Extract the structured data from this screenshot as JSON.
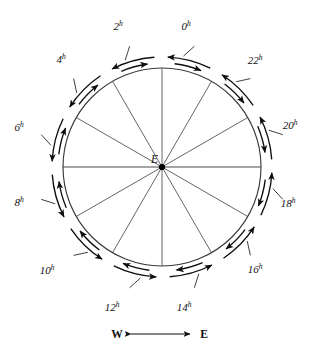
{
  "figure": {
    "type": "tidal-hour-diagram",
    "center_label": "E",
    "circle": {
      "cx": 162,
      "cy": 167,
      "r": 99
    },
    "spoke_count": 12,
    "spoke_step_degrees": 30,
    "hour_marks": [
      {
        "label": "0",
        "sup": "h",
        "angle_deg": 15,
        "label_x": 186,
        "label_y": 30
      },
      {
        "label": "2",
        "sup": "h",
        "angle_deg": 45,
        "label_x": 118,
        "label_y": 30
      },
      {
        "label": "4",
        "sup": "h",
        "angle_deg": 75,
        "label_x": 61,
        "label_y": 63
      },
      {
        "label": "6",
        "sup": "h",
        "angle_deg": 105,
        "label_x": 19,
        "label_y": 131
      },
      {
        "label": "8",
        "sup": "h",
        "angle_deg": 135,
        "label_x": 19,
        "label_y": 206
      },
      {
        "label": "10",
        "sup": "h",
        "angle_deg": 165,
        "label_x": 47,
        "label_y": 274
      },
      {
        "label": "12",
        "sup": "h",
        "angle_deg": 195,
        "label_x": 112,
        "label_y": 311
      },
      {
        "label": "14",
        "sup": "h",
        "angle_deg": 225,
        "label_x": 184,
        "label_y": 311
      },
      {
        "label": "16",
        "sup": "h",
        "angle_deg": 255,
        "label_x": 255,
        "label_y": 273
      },
      {
        "label": "18",
        "sup": "h",
        "angle_deg": 285,
        "label_x": 288,
        "label_y": 207
      },
      {
        "label": "20",
        "sup": "h",
        "angle_deg": 315,
        "label_x": 290,
        "label_y": 129
      },
      {
        "label": "22",
        "sup": "h",
        "angle_deg": 345,
        "label_x": 255,
        "label_y": 64
      }
    ],
    "legend": {
      "left_label": "W",
      "right_label": "E",
      "arrow": "double-headed-horizontal"
    },
    "colors": {
      "stroke": "#0d0d0d",
      "circle": "#3a3a3a",
      "spoke": "#4a4a4a",
      "background": "#ffffff"
    }
  }
}
